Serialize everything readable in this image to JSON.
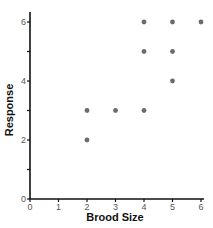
{
  "chart_data": {
    "type": "scatter",
    "title": "",
    "xlabel": "Brood Size",
    "ylabel": "Response",
    "xlim": [
      0,
      6
    ],
    "ylim": [
      0,
      6
    ],
    "x_ticks": [
      0,
      1,
      2,
      3,
      4,
      5,
      6
    ],
    "y_ticks": [
      0,
      1,
      2,
      3,
      4,
      5,
      6
    ],
    "x_tick_labels": [
      "0",
      "1",
      "2",
      "3",
      "4",
      "5",
      "6"
    ],
    "y_tick_labels": [
      "0",
      "",
      "2",
      "",
      "4",
      "",
      "6"
    ],
    "grid": false,
    "legend": null,
    "series": [
      {
        "name": "observations",
        "color": "#6b6b6b",
        "points": [
          {
            "x": 2,
            "y": 2
          },
          {
            "x": 2,
            "y": 3
          },
          {
            "x": 3,
            "y": 3
          },
          {
            "x": 4,
            "y": 3
          },
          {
            "x": 4,
            "y": 5
          },
          {
            "x": 4,
            "y": 6
          },
          {
            "x": 5,
            "y": 4
          },
          {
            "x": 5,
            "y": 5
          },
          {
            "x": 5,
            "y": 6
          },
          {
            "x": 6,
            "y": 6
          }
        ]
      }
    ]
  },
  "colors": {
    "axis": "#111111",
    "point": "#6b6b6b",
    "tick_label": "#555555"
  }
}
